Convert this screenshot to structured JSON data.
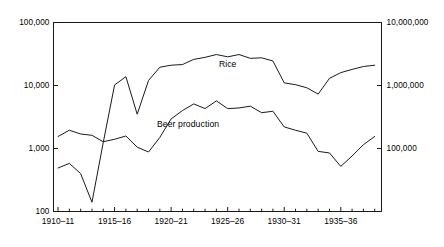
{
  "chart_data": {
    "type": "line",
    "title": "",
    "subtitle": "",
    "xlabel": "",
    "ylabel": "",
    "ylabel_right": "",
    "grid": false,
    "legend_position": "inline-annotation",
    "yscale": "log",
    "xscale": "linear",
    "ylim": [
      100,
      100000
    ],
    "ylim_right": [
      100000,
      10000000
    ],
    "y_ticks_left": [
      "100",
      "1,000",
      "10,000",
      "100,000"
    ],
    "y_ticks_left_values": [
      100,
      1000,
      10000,
      100000
    ],
    "y_ticks_right": [
      "100,000",
      "1,000,000",
      "10,000,000"
    ],
    "y_ticks_right_values": [
      100000,
      1000000,
      10000000
    ],
    "x_tick_labels": [
      "1910–11",
      "1915–16",
      "1920–21",
      "1925–26",
      "1930–31",
      "1935–36"
    ],
    "x_tick_values": [
      1910,
      1915,
      1920,
      1925,
      1930,
      1935
    ],
    "x_minor_tick_values": [
      1911,
      1912,
      1913,
      1914,
      1916,
      1917,
      1918,
      1919,
      1921,
      1922,
      1923,
      1924,
      1926,
      1927,
      1928,
      1929,
      1931,
      1932,
      1933,
      1934,
      1936,
      1937,
      1938
    ],
    "xlim": [
      1909.6,
      1938.6
    ],
    "series": [
      {
        "name": "Rice",
        "axis": "left",
        "color": "#1a1a1a",
        "label_x": 1925.0,
        "label_y": 22000,
        "x": [
          1910,
          1911,
          1912,
          1913,
          1914,
          1915,
          1916,
          1917,
          1918,
          1919,
          1920,
          1921,
          1922,
          1923,
          1924,
          1925,
          1926,
          1927,
          1928,
          1929,
          1930,
          1931,
          1932,
          1933,
          1934,
          1935,
          1936,
          1937,
          1938
        ],
        "values": [
          490,
          580,
          400,
          140,
          1250,
          10200,
          13800,
          3500,
          12000,
          19500,
          21000,
          21500,
          26000,
          28000,
          31000,
          28500,
          31000,
          27000,
          27500,
          24500,
          11000,
          10300,
          9200,
          7300,
          13000,
          16000,
          18000,
          20000,
          21000
        ]
      },
      {
        "name": "Beer production",
        "axis": "left",
        "color": "#1a1a1a",
        "label_x": 1921.5,
        "label_y": 2450,
        "x": [
          1910,
          1911,
          1912,
          1913,
          1914,
          1915,
          1916,
          1917,
          1918,
          1919,
          1920,
          1921,
          1922,
          1923,
          1924,
          1925,
          1926,
          1927,
          1928,
          1929,
          1930,
          1931,
          1932,
          1933,
          1934,
          1935,
          1936,
          1937,
          1938
        ],
        "values": [
          1550,
          1950,
          1700,
          1620,
          1280,
          1400,
          1580,
          1050,
          880,
          1500,
          2950,
          4000,
          5100,
          4300,
          5700,
          4300,
          4400,
          4700,
          3700,
          3900,
          2200,
          1950,
          1750,
          900,
          850,
          520,
          760,
          1150,
          1550
        ]
      }
    ],
    "annotations": [
      {
        "text": "Rice",
        "x": 1925.0,
        "y": 22000
      },
      {
        "text": "Beer production",
        "x": 1921.5,
        "y": 2450
      }
    ]
  },
  "axes": {
    "left": {
      "ticks": [
        {
          "label": "100,000",
          "value": 100000
        },
        {
          "label": "10,000",
          "value": 10000
        },
        {
          "label": "1,000",
          "value": 1000
        },
        {
          "label": "100",
          "value": 100
        }
      ]
    },
    "right": {
      "ticks": [
        {
          "label": "10,000,000",
          "value": 10000000
        },
        {
          "label": "1,000,000",
          "value": 1000000
        },
        {
          "label": "100,000",
          "value": 100000
        }
      ]
    },
    "bottom": {
      "ticks": [
        {
          "label": "1910–11",
          "value": 1910
        },
        {
          "label": "1915–16",
          "value": 1915
        },
        {
          "label": "1920–21",
          "value": 1920
        },
        {
          "label": "1925–26",
          "value": 1925
        },
        {
          "label": "1930–31",
          "value": 1930
        },
        {
          "label": "1935–36",
          "value": 1935
        }
      ]
    }
  },
  "style": {
    "background": "#ffffff",
    "axis_color": "#1a1a1a",
    "line_color": "#1a1a1a",
    "text_color": "#000000"
  }
}
